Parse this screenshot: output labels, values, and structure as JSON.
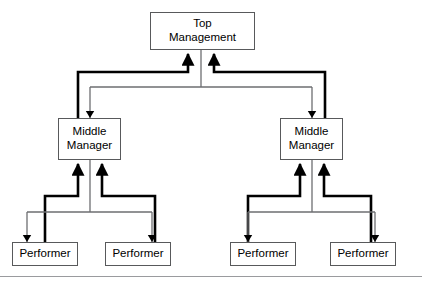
{
  "diagram": {
    "type": "organization-chart",
    "colors": {
      "box_border": "#58595b",
      "box_fill": "#ffffff",
      "thick_connector": "#000000",
      "thin_connector": "#6d6e71",
      "footer_rule": "#9a9b9e",
      "text": "#000000",
      "background": "#ffffff"
    },
    "nodes": {
      "top_management": {
        "label": "Top\nManagement",
        "line1": "Top",
        "line2": "Management",
        "level": "top",
        "x": 150,
        "y": 12,
        "width": 105,
        "height": 38
      },
      "middle_manager_left": {
        "label": "Middle\nManager",
        "line1": "Middle",
        "line2": "Manager",
        "level": "middle",
        "x": 58,
        "y": 118,
        "width": 63,
        "height": 42
      },
      "middle_manager_right": {
        "label": "Middle\nManager",
        "line1": "Middle",
        "line2": "Manager",
        "level": "middle",
        "x": 280,
        "y": 118,
        "width": 63,
        "height": 42
      },
      "performer_1": {
        "label": "Performer",
        "level": "performer",
        "x": 12,
        "y": 242,
        "width": 66,
        "height": 24
      },
      "performer_2": {
        "label": "Performer",
        "level": "performer",
        "x": 105,
        "y": 242,
        "width": 66,
        "height": 24
      },
      "performer_3": {
        "label": "Performer",
        "level": "performer",
        "x": 230,
        "y": 242,
        "width": 66,
        "height": 24
      },
      "performer_4": {
        "label": "Performer",
        "level": "performer",
        "x": 330,
        "y": 242,
        "width": 66,
        "height": 24
      }
    },
    "connections": [
      {
        "from": "middle_manager_left",
        "to": "top_management",
        "direction": "up",
        "weight": "thick",
        "meaning": "reporting"
      },
      {
        "from": "middle_manager_right",
        "to": "top_management",
        "direction": "up",
        "weight": "thick",
        "meaning": "reporting"
      },
      {
        "from": "top_management",
        "to": "middle_manager_left",
        "direction": "down",
        "weight": "thin",
        "meaning": "direction"
      },
      {
        "from": "top_management",
        "to": "middle_manager_right",
        "direction": "down",
        "weight": "thin",
        "meaning": "direction"
      },
      {
        "from": "performer_1",
        "to": "middle_manager_left",
        "direction": "up",
        "weight": "thick",
        "meaning": "reporting"
      },
      {
        "from": "performer_2",
        "to": "middle_manager_left",
        "direction": "up",
        "weight": "thick",
        "meaning": "reporting"
      },
      {
        "from": "middle_manager_left",
        "to": "performer_1",
        "direction": "down",
        "weight": "thin",
        "meaning": "direction"
      },
      {
        "from": "middle_manager_left",
        "to": "performer_2",
        "direction": "down",
        "weight": "thin",
        "meaning": "direction"
      },
      {
        "from": "performer_3",
        "to": "middle_manager_right",
        "direction": "up",
        "weight": "thick",
        "meaning": "reporting"
      },
      {
        "from": "performer_4",
        "to": "middle_manager_right",
        "direction": "up",
        "weight": "thick",
        "meaning": "reporting"
      },
      {
        "from": "middle_manager_right",
        "to": "performer_3",
        "direction": "down",
        "weight": "thin",
        "meaning": "direction"
      },
      {
        "from": "middle_manager_right",
        "to": "performer_4",
        "direction": "down",
        "weight": "thin",
        "meaning": "direction"
      }
    ]
  }
}
